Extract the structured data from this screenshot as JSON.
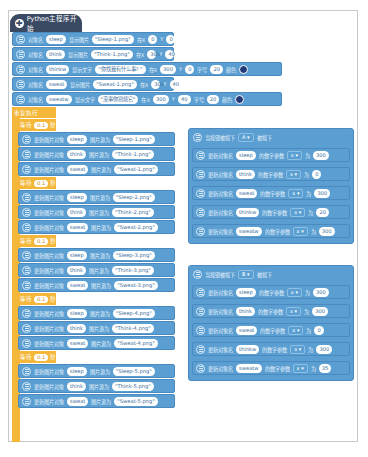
{
  "start_block": {
    "label": "Python主程序开始"
  },
  "init_blocks": [
    {
      "l1": "对象名",
      "name": "sleep",
      "l2": "显示图片",
      "value": "\"Sleep-1.png\"",
      "l3": "在X",
      "x": "0",
      "l4": "Y",
      "y": "0"
    },
    {
      "l1": "对象名",
      "name": "think",
      "l2": "显示图片",
      "value": "\"Think-1.png\"",
      "l3": "在X",
      "x": "300",
      "l4": "Y",
      "y": "40"
    },
    {
      "l1": "对象名",
      "name": "thinkw",
      "l2": "显示文字",
      "value": "\"你找我有什么事? \"",
      "l3": "在X",
      "x": "300",
      "l4": "Y",
      "y": "0",
      "l5": "字号",
      "size": "20",
      "l6": "颜色",
      "color": "#233a78"
    },
    {
      "l1": "对象名",
      "name": "sweat",
      "l2": "显示图片",
      "value": "\"Sweat-1.png\"",
      "l3": "在X",
      "x": "300",
      "l4": "Y",
      "y": "40"
    },
    {
      "l1": "对象名",
      "name": "sweatw",
      "l2": "显示文字",
      "value": "\"没事你别烦它\"",
      "l3": "在X",
      "x": "300",
      "l4": "Y",
      "y": "40",
      "l5": "字号",
      "size": "20",
      "l6": "颜色",
      "color": "#233a78"
    }
  ],
  "loop": {
    "label": "重复执行",
    "wait_label": "等待",
    "wait_value": "0.1",
    "wait_unit": "秒",
    "update_label": "更新图片对象",
    "source_label": "图片源为",
    "frames": [
      [
        {
          "name": "sleep",
          "src": "\"Sleep-1.png\""
        },
        {
          "name": "think",
          "src": "\"Think-1.png\""
        },
        {
          "name": "sweat",
          "src": "\"Sweat-1.png\""
        }
      ],
      [
        {
          "name": "sleep",
          "src": "\"Sleep-2.png\""
        },
        {
          "name": "think",
          "src": "\"Think-2.png\""
        },
        {
          "name": "sweat",
          "src": "\"Sweat-2.png\""
        }
      ],
      [
        {
          "name": "sleep",
          "src": "\"Sleep-3.png\""
        },
        {
          "name": "think",
          "src": "\"Think-3.png\""
        },
        {
          "name": "sweat",
          "src": "\"Sweat-3.png\""
        }
      ],
      [
        {
          "name": "sleep",
          "src": "\"Sleep-4.png\""
        },
        {
          "name": "think",
          "src": "\"Think-4.png\""
        },
        {
          "name": "sweat",
          "src": "\"Sweat-4.png\""
        }
      ],
      [
        {
          "name": "sleep",
          "src": "\"Sleep-5.png\""
        },
        {
          "name": "think",
          "src": "\"Think-5.png\""
        },
        {
          "name": "sweat",
          "src": "\"Sweat-5.png\""
        }
      ]
    ]
  },
  "key_events": [
    {
      "head": {
        "l1": "当按键被按下",
        "key": "A ▾",
        "l2": "被按下"
      },
      "rows": [
        {
          "l1": "更新对象名",
          "name": "sleep",
          "l2": "的数字参数",
          "param": "x ▾",
          "l3": "为",
          "value": "300"
        },
        {
          "l1": "更新对象名",
          "name": "think",
          "l2": "的数字参数",
          "param": "x ▾",
          "l3": "为",
          "value": "0"
        },
        {
          "l1": "更新对象名",
          "name": "sweat",
          "l2": "的数字参数",
          "param": "x ▾",
          "l3": "为",
          "value": "300"
        },
        {
          "l1": "更新对象名",
          "name": "thinkw",
          "l2": "的数字参数",
          "param": "x ▾",
          "l3": "为",
          "value": "20"
        },
        {
          "l1": "更新对象名",
          "name": "sweatw",
          "l2": "的数字参数",
          "param": "x ▾",
          "l3": "为",
          "value": "300"
        }
      ]
    },
    {
      "head": {
        "l1": "当按键被按下",
        "key": "B ▾",
        "l2": "被按下"
      },
      "rows": [
        {
          "l1": "更新对象名",
          "name": "sleep",
          "l2": "的数字参数",
          "param": "x ▾",
          "l3": "为",
          "value": "300"
        },
        {
          "l1": "更新对象名",
          "name": "think",
          "l2": "的数字参数",
          "param": "x ▾",
          "l3": "为",
          "value": "300"
        },
        {
          "l1": "更新对象名",
          "name": "sweat",
          "l2": "的数字参数",
          "param": "x ▾",
          "l3": "为",
          "value": "0"
        },
        {
          "l1": "更新对象名",
          "name": "thinkw",
          "l2": "的数字参数",
          "param": "x ▾",
          "l3": "为",
          "value": "300"
        },
        {
          "l1": "更新对象名",
          "name": "sweatw",
          "l2": "的数字参数",
          "param": "x ▾",
          "l3": "为",
          "value": "35"
        }
      ]
    }
  ],
  "colors": {
    "block_blue": "#5b9fd2",
    "hat_dark": "#3a4a63",
    "loop_orange": "#f4b73a",
    "text_color": "#233a78"
  }
}
